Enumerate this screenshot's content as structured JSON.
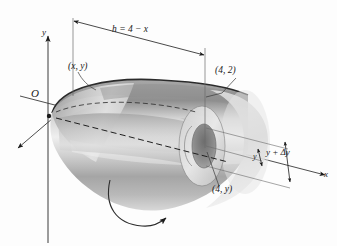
{
  "figure": {
    "background_color": "#fdfdfd",
    "ink_color": "#1a1a1a",
    "labels": {
      "origin": "O",
      "y_axis": "y",
      "x_axis": "x",
      "height_dimension": "h = 4 − x",
      "curve_point": "(x, y)",
      "top_right_point": "(4, 2)",
      "inner_point": "(4, y)",
      "shell_outer": "y + Δy",
      "shell_inner": "y"
    },
    "shading": {
      "solid_light": "#e8e8e8",
      "solid_mid": "#c9c9c9",
      "solid_dark": "#9a9a9a",
      "solid_darkest": "#7d7d7d",
      "shell_band": "#b5b5b5",
      "highlight": "#f2f2f2"
    }
  }
}
